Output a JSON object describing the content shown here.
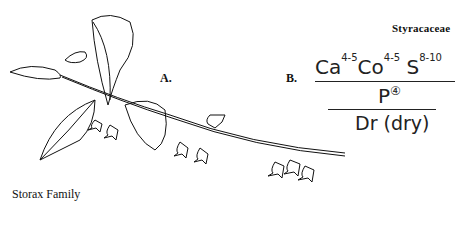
{
  "family_name": "Styracaceae",
  "common_name": "Storax Family",
  "labels": {
    "a": "A.",
    "b": "B."
  },
  "formula": {
    "calyx": "Ca",
    "calyx_count": "4-5",
    "corolla": "Co",
    "corolla_count": "4-5",
    "stamens": "S",
    "stamens_count": "8-10",
    "pistil": "P",
    "pistil_count": "④",
    "fruit": "Dr (dry)"
  },
  "illustration": "branch with leaves and bell-shaped hanging flowers"
}
